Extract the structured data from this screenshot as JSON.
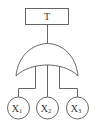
{
  "diagram": {
    "type": "fault-tree",
    "top_event": {
      "label": "T"
    },
    "gate": {
      "type": "OR"
    },
    "basic_events": [
      {
        "label": "X",
        "subscript": "1"
      },
      {
        "label": "X",
        "subscript": "2"
      },
      {
        "label": "X",
        "subscript": "3"
      }
    ],
    "colors": {
      "line": "#555555",
      "text": "#333333",
      "background": "#ffffff"
    }
  }
}
